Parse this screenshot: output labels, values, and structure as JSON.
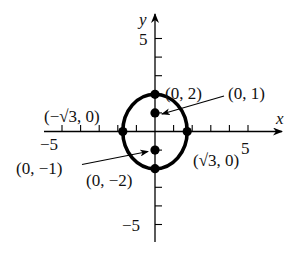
{
  "diagram": {
    "title": "",
    "axes": {
      "x_label": "x",
      "y_label": "y",
      "x_tick_label_neg": "−5",
      "x_tick_label_pos": "5",
      "y_tick_label_pos": "5",
      "y_tick_label_neg": "−5",
      "range": [
        -6,
        6
      ],
      "tick_step": 1
    },
    "curve": {
      "type": "ellipse",
      "equation_hint": "x^2/3 + y^2/4 = 1",
      "semi_x": 1.732,
      "semi_y": 2,
      "stroke": "#000000"
    },
    "points": [
      {
        "label": "(0, 2)",
        "x": 0,
        "y": 2
      },
      {
        "label": "(0, 1)",
        "x": 0,
        "y": 1,
        "arrow": true
      },
      {
        "label": "(−√3, 0)",
        "x": -1.732,
        "y": 0
      },
      {
        "label": "(√3, 0)",
        "x": 1.732,
        "y": 0
      },
      {
        "label": "(0, −1)",
        "x": 0,
        "y": -1,
        "arrow": true
      },
      {
        "label": "(0, −2)",
        "x": 0,
        "y": -2
      }
    ],
    "labels": {
      "p_top": "(0, 2)",
      "p_focus_up": "(0, 1)",
      "p_left": "(−√3, 0)",
      "p_right": "(√3, 0)",
      "p_focus_down": "(0, −1)",
      "p_bottom": "(0, −2)"
    }
  }
}
